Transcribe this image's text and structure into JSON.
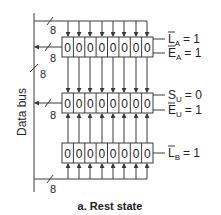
{
  "bus_label": "Data bus",
  "bus_width": "8",
  "caption": "a.  Rest state",
  "registers": [
    {
      "name": "A",
      "bits": [
        "0",
        "0",
        "0",
        "0",
        "0",
        "0",
        "0",
        "0"
      ],
      "controls": [
        {
          "sig": "L",
          "bar": true,
          "sub": "A",
          "val": "= 1"
        },
        {
          "sig": "E",
          "bar": true,
          "sub": "A",
          "val": "= 1"
        }
      ]
    },
    {
      "name": "U",
      "bits": [
        "0",
        "0",
        "0",
        "0",
        "0",
        "0",
        "0",
        "0"
      ],
      "controls": [
        {
          "sig": "S",
          "bar": false,
          "sub": "U",
          "val": "= 0"
        },
        {
          "sig": "E",
          "bar": true,
          "sub": "U",
          "val": "= 1"
        }
      ]
    },
    {
      "name": "B",
      "bits": [
        "0",
        "0",
        "0",
        "0",
        "0",
        "0",
        "0",
        "0"
      ],
      "controls": [
        {
          "sig": "L",
          "bar": true,
          "sub": "B",
          "val": "= 1"
        }
      ]
    }
  ],
  "colors": {
    "line": "#3a3a3a",
    "text": "#222222",
    "background": "#ffffff"
  }
}
